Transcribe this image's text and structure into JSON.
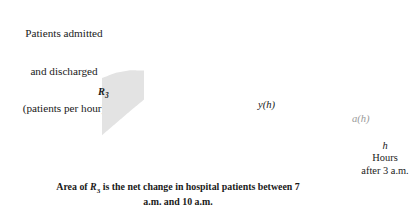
{
  "chart_data": {
    "type": "line",
    "title": "",
    "caption": "Area of R₃ is the net change in hospital patients between 7 a.m. and 10 a.m.",
    "ylabel_lines": [
      "Patients admitted",
      "and discharged",
      "(patients per hour)"
    ],
    "xlabel_lines": [
      "h",
      "Hours",
      "after 3 a.m."
    ],
    "xlabel_italic": "h",
    "xlim": [
      0,
      23
    ],
    "ylim": [
      0,
      28
    ],
    "grid": false,
    "legend": "inline-curve-labels",
    "x_ticks_major": [
      0,
      4,
      8,
      12,
      16,
      20
    ],
    "x_ticks_minor": [
      2,
      6,
      10,
      14,
      18,
      22
    ],
    "x_tick_labels": [
      "0",
      "4",
      "8",
      "12",
      "16",
      "20"
    ],
    "y_ticks": [
      0,
      5,
      10,
      15,
      20,
      25
    ],
    "y_tick_labels": [
      "0",
      "5",
      "10",
      "15",
      "20",
      "25"
    ],
    "series": [
      {
        "name": "a(h)",
        "label": "a(h)",
        "color": "#9a9a9a",
        "style": "solid-gray",
        "points": [
          [
            0,
            8.0
          ],
          [
            1,
            11.6
          ],
          [
            2,
            14.7
          ],
          [
            3,
            17.3
          ],
          [
            4,
            19.3
          ],
          [
            5,
            20.6
          ],
          [
            6,
            21.2
          ],
          [
            7,
            21.1
          ],
          [
            8,
            20.3
          ],
          [
            9,
            18.9
          ],
          [
            10,
            17.0
          ],
          [
            11,
            14.8
          ],
          [
            12,
            12.5
          ],
          [
            13,
            10.2
          ],
          [
            14,
            8.0
          ],
          [
            15,
            6.0
          ],
          [
            16,
            4.3
          ],
          [
            17,
            3.0
          ],
          [
            18,
            2.0
          ],
          [
            19,
            1.4
          ],
          [
            20,
            1.2
          ],
          [
            21,
            1.7
          ],
          [
            22,
            2.9
          ],
          [
            23,
            4.7
          ]
        ]
      },
      {
        "name": "y(h)",
        "label": "y(h)",
        "color": "#1a1a1a",
        "style": "solid-black-thick",
        "points": [
          [
            4,
            5.5
          ],
          [
            5,
            8.4
          ],
          [
            6,
            11.3
          ],
          [
            7,
            14.1
          ],
          [
            8,
            16.8
          ],
          [
            9,
            19.3
          ],
          [
            10,
            21.5
          ],
          [
            11,
            23.4
          ],
          [
            12,
            24.9
          ],
          [
            13,
            25.8
          ],
          [
            14,
            26.0
          ],
          [
            15,
            25.2
          ],
          [
            16,
            22.7
          ],
          [
            16.6,
            19.8
          ],
          [
            16.9,
            17.2
          ]
        ]
      }
    ],
    "shaded_region": {
      "label": "R₃",
      "x_start": 4,
      "x_end": 7,
      "upper_curve": "a(h)",
      "lower_curve": "y(h)",
      "fill": "#e3e3e3"
    },
    "axis_segments": [
      {
        "from": 0,
        "to": 4,
        "color": "#1a1a1a",
        "weight": "bold"
      },
      {
        "from": 4,
        "to": 17,
        "color": "#9a9a9a",
        "weight": "normal"
      },
      {
        "from": 17,
        "to": 23,
        "color": "#1a1a1a",
        "weight": "bold"
      }
    ],
    "open_circles": [
      [
        4,
        0
      ],
      [
        17,
        0
      ]
    ],
    "vertical_boundaries": [
      {
        "x": 4,
        "y_from": 0,
        "y_to": 19.3
      },
      {
        "x": 7,
        "y_from": 0,
        "y_to": 21.1
      }
    ]
  }
}
